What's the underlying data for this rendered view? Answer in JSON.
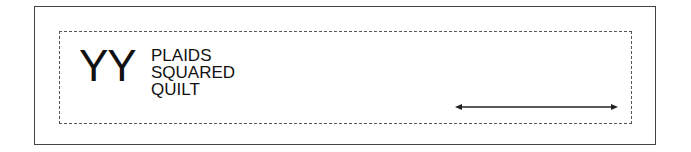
{
  "label": {
    "logo": "YY",
    "lines": [
      "PLAIDS",
      "SQUARED",
      "QUILT"
    ]
  },
  "dimension_arrow": {
    "type": "double-headed"
  },
  "colors": {
    "stroke": "#444444",
    "text": "#111111",
    "background": "#ffffff"
  }
}
